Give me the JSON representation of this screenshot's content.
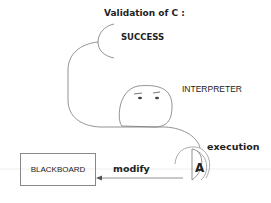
{
  "title": "Validation of C :",
  "result": "SUCCESS",
  "agent_label": "INTERPRETER",
  "action_label": "execution",
  "target_label": "BLACKBOARD",
  "edge_label": "modify",
  "actor_symbol": "A"
}
